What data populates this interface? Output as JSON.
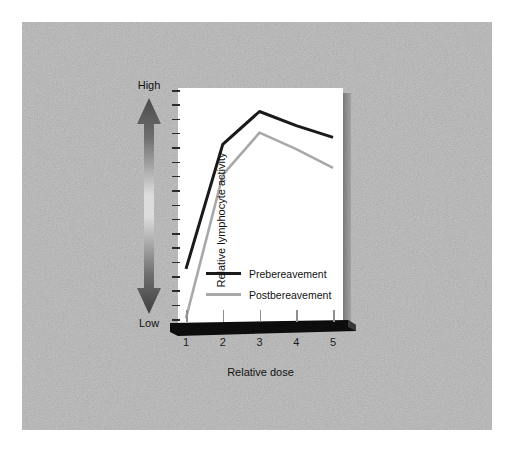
{
  "figure": {
    "background_color": "#b6b6b6",
    "panel_color": "#ffffff",
    "shadow_color": "#7a7a7a"
  },
  "axis_arrow": {
    "high_label": "High",
    "low_label": "Low",
    "icon": "double-headed-vertical-arrow"
  },
  "chart_data": {
    "type": "line",
    "title": "",
    "xlabel": "Relative dose",
    "ylabel": "Relative lymphocyte activity",
    "x": [
      1,
      2,
      3,
      4,
      5
    ],
    "xticklabels": [
      "1",
      "2",
      "3",
      "4",
      "5"
    ],
    "ylim": [
      0,
      100
    ],
    "yticklabels": [],
    "y_axis_minor_ticks": 17,
    "grid": false,
    "legend_position": "center",
    "series": [
      {
        "name": "Prebereavement",
        "color": "#1a1a1a",
        "values": [
          23,
          76,
          90,
          84,
          79
        ]
      },
      {
        "name": "Postbereavement",
        "color": "#a8a8a8",
        "values": [
          2,
          63,
          81,
          74,
          66
        ]
      }
    ]
  }
}
